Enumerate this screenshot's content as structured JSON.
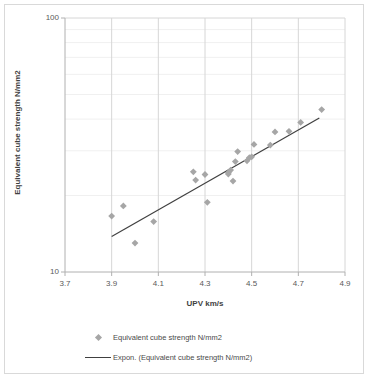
{
  "chart_data": {
    "type": "scatter",
    "title": "",
    "xlabel": "UPV km/s",
    "ylabel": "Equivalent cube strength N/mm2",
    "xlim": [
      3.7,
      4.9
    ],
    "ylim": [
      10,
      100
    ],
    "yscale": "log",
    "xscale": "linear",
    "xticks": [
      "3.7",
      "3.9",
      "4.1",
      "4.3",
      "4.5",
      "4.7",
      "4.9"
    ],
    "yticks": [
      "10",
      "100"
    ],
    "grid": "major vertical gridlines, faint minor horizontal log gridlines",
    "legend_position": "bottom",
    "marker_color": "#a6a6a6",
    "marker_shape": "diamond",
    "trendline_color": "#404040",
    "series": [
      {
        "name": "Equivalent cube strength N/mm2",
        "type": "scatter",
        "points": [
          {
            "x": 3.9,
            "y": 16.6
          },
          {
            "x": 3.95,
            "y": 18.2
          },
          {
            "x": 4.0,
            "y": 13.0
          },
          {
            "x": 4.08,
            "y": 15.8
          },
          {
            "x": 4.25,
            "y": 24.8
          },
          {
            "x": 4.26,
            "y": 23.0
          },
          {
            "x": 4.3,
            "y": 24.2
          },
          {
            "x": 4.31,
            "y": 18.8
          },
          {
            "x": 4.4,
            "y": 24.3
          },
          {
            "x": 4.4,
            "y": 24.6
          },
          {
            "x": 4.41,
            "y": 25.2
          },
          {
            "x": 4.42,
            "y": 22.8
          },
          {
            "x": 4.43,
            "y": 27.2
          },
          {
            "x": 4.44,
            "y": 29.8
          },
          {
            "x": 4.48,
            "y": 27.4
          },
          {
            "x": 4.49,
            "y": 28.2
          },
          {
            "x": 4.5,
            "y": 28.4
          },
          {
            "x": 4.51,
            "y": 31.8
          },
          {
            "x": 4.58,
            "y": 31.6
          },
          {
            "x": 4.6,
            "y": 35.6
          },
          {
            "x": 4.66,
            "y": 35.8
          },
          {
            "x": 4.71,
            "y": 38.8
          },
          {
            "x": 4.8,
            "y": 43.6
          }
        ]
      },
      {
        "name": "Expon. (Equivalent cube strength N/mm2)",
        "type": "line",
        "points": [
          {
            "x": 3.9,
            "y": 13.8
          },
          {
            "x": 4.79,
            "y": 40.4
          }
        ]
      }
    ]
  },
  "legend": {
    "items": [
      {
        "key": "marker-diamond",
        "label": "Equivalent cube strength N/mm2"
      },
      {
        "key": "line-solid",
        "label": "Expon. (Equivalent cube strength N/mm2)"
      }
    ]
  }
}
